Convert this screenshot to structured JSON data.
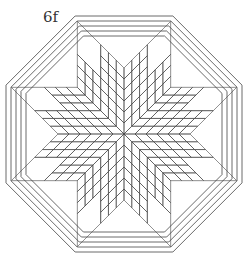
{
  "figure": {
    "label": "6f",
    "stroke_color": "#444444",
    "background": "#ffffff"
  },
  "geometry": {
    "center": [
      124,
      134
    ],
    "outer_radius": 128,
    "border_strips": 4,
    "star_points": 8
  }
}
